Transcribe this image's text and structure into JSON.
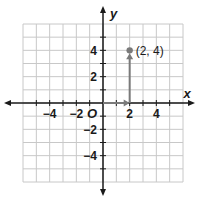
{
  "figure": {
    "type": "coordinate-plane",
    "x_range": [
      -6,
      6
    ],
    "y_range": [
      -6,
      6
    ],
    "grid_step": 1,
    "x_axis_label": "x",
    "y_axis_label": "y",
    "origin_label": "O",
    "x_tick_labels": [
      {
        "value": -4,
        "text": "−4"
      },
      {
        "value": -2,
        "text": "−2"
      },
      {
        "value": 2,
        "text": "2"
      },
      {
        "value": 4,
        "text": "4"
      }
    ],
    "y_tick_labels": [
      {
        "value": 4,
        "text": "4"
      },
      {
        "value": 2,
        "text": "2"
      },
      {
        "value": -2,
        "text": "−2"
      },
      {
        "value": -4,
        "text": "−4"
      }
    ],
    "point": {
      "x": 2,
      "y": 4,
      "label": "(2, 4)"
    },
    "path_arrows": [
      {
        "from": [
          0,
          0
        ],
        "to": [
          2,
          0
        ],
        "direction": "right"
      },
      {
        "from": [
          2,
          0
        ],
        "to": [
          2,
          4
        ],
        "direction": "up"
      }
    ],
    "colors": {
      "grid": "#c8c8c8",
      "axis": "#1a1a1a",
      "path": "#7a7a7a",
      "point": "#7a7a7a"
    }
  }
}
